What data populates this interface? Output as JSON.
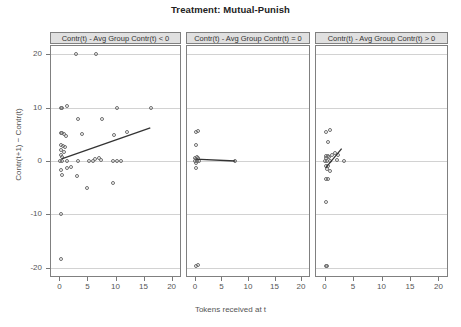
{
  "chart_data": {
    "type": "scatter",
    "title": "Treatment: Mutual-Punish",
    "xlabel": "Tokens received at t",
    "ylabel": "Contr(t+1) − Contr(t)",
    "xlim": [
      -1.5,
      21.5
    ],
    "ylim": [
      -21.5,
      21.5
    ],
    "xticks": [
      0,
      5,
      10,
      15,
      20
    ],
    "yticks": [
      20,
      10,
      0,
      -10,
      -20
    ],
    "xtick_labels": [
      "0",
      "5",
      "10",
      "15",
      "20"
    ],
    "ytick_labels": [
      "20",
      "10",
      "0",
      "-10",
      "-20"
    ],
    "grid": "horizontal-only",
    "legend": "none",
    "marker": "open-circle",
    "marker_color": "#6e6e6e",
    "fit_color": "#333333",
    "strip_bg": "#e0e0e0",
    "panels": [
      {
        "label": "Contr(t) - Avg Group Contr(t) < 0",
        "points": [
          [
            3.0,
            20.0
          ],
          [
            6.5,
            20.0
          ],
          [
            0.2,
            10.0
          ],
          [
            0.5,
            10.0
          ],
          [
            1.3,
            10.2
          ],
          [
            10.2,
            10.0
          ],
          [
            16.3,
            10.0
          ],
          [
            3.3,
            7.8
          ],
          [
            7.6,
            7.8
          ],
          [
            0.2,
            5.3
          ],
          [
            0.5,
            5.2
          ],
          [
            0.9,
            5.0
          ],
          [
            1.1,
            4.6
          ],
          [
            4.0,
            5.0
          ],
          [
            9.8,
            4.8
          ],
          [
            12.0,
            5.5
          ],
          [
            0.2,
            3.0
          ],
          [
            0.6,
            2.8
          ],
          [
            1.0,
            2.6
          ],
          [
            0.3,
            2.0
          ],
          [
            0.8,
            1.6
          ],
          [
            0.2,
            1.2
          ],
          [
            0.5,
            0.8
          ],
          [
            0.1,
            0.0
          ],
          [
            0.5,
            0.0
          ],
          [
            1.3,
            0.0
          ],
          [
            3.4,
            0.0
          ],
          [
            5.2,
            0.0
          ],
          [
            6.0,
            0.0
          ],
          [
            6.4,
            0.3
          ],
          [
            7.0,
            0.5
          ],
          [
            7.4,
            0.2
          ],
          [
            9.6,
            0.0
          ],
          [
            10.3,
            0.0
          ],
          [
            11.0,
            0.0
          ],
          [
            0.2,
            -1.6
          ],
          [
            1.3,
            -1.4
          ],
          [
            2.0,
            -1.2
          ],
          [
            0.4,
            -2.6
          ],
          [
            3.2,
            -2.8
          ],
          [
            5.0,
            -5.0
          ],
          [
            9.6,
            -4.2
          ],
          [
            0.3,
            -10.0
          ],
          [
            0.3,
            -18.4
          ]
        ],
        "fit": [
          [
            0.4,
            0.4
          ],
          [
            16.2,
            6.2
          ]
        ]
      },
      {
        "label": "Contr(t) - Avg Group Contr(t) = 0",
        "points": [
          [
            0.15,
            5.4
          ],
          [
            0.55,
            5.6
          ],
          [
            0.2,
            3.0
          ],
          [
            0.1,
            0.6
          ],
          [
            0.35,
            0.7
          ],
          [
            0.5,
            0.5
          ],
          [
            0.18,
            0.3
          ],
          [
            0.1,
            0.0
          ],
          [
            0.4,
            0.0
          ],
          [
            0.7,
            0.0
          ],
          [
            0.25,
            -0.3
          ],
          [
            0.12,
            -1.4
          ],
          [
            7.6,
            0.0
          ],
          [
            0.15,
            -19.6
          ],
          [
            0.55,
            -19.4
          ]
        ],
        "fit": [
          [
            0.1,
            0.35
          ],
          [
            7.6,
            0.0
          ]
        ]
      },
      {
        "label": "Contr(t) - Avg Group Contr(t) > 0",
        "points": [
          [
            0.2,
            5.4
          ],
          [
            1.0,
            5.8
          ],
          [
            0.6,
            3.6
          ],
          [
            0.2,
            1.0
          ],
          [
            0.55,
            1.0
          ],
          [
            0.3,
            0.6
          ],
          [
            0.75,
            0.7
          ],
          [
            1.3,
            1.2
          ],
          [
            1.9,
            1.5
          ],
          [
            2.4,
            1.2
          ],
          [
            0.15,
            0.0
          ],
          [
            0.5,
            0.0
          ],
          [
            0.9,
            0.0
          ],
          [
            2.2,
            0.2
          ],
          [
            3.5,
            0.0
          ],
          [
            0.2,
            -0.9
          ],
          [
            0.6,
            -1.0
          ],
          [
            0.35,
            -1.5
          ],
          [
            0.9,
            -1.8
          ],
          [
            0.25,
            -3.3
          ],
          [
            0.6,
            -3.4
          ],
          [
            0.2,
            -7.6
          ],
          [
            0.2,
            -19.6
          ],
          [
            0.45,
            -19.6
          ]
        ],
        "fit": [
          [
            0.2,
            -1.3
          ],
          [
            3.0,
            2.3
          ]
        ]
      }
    ]
  }
}
